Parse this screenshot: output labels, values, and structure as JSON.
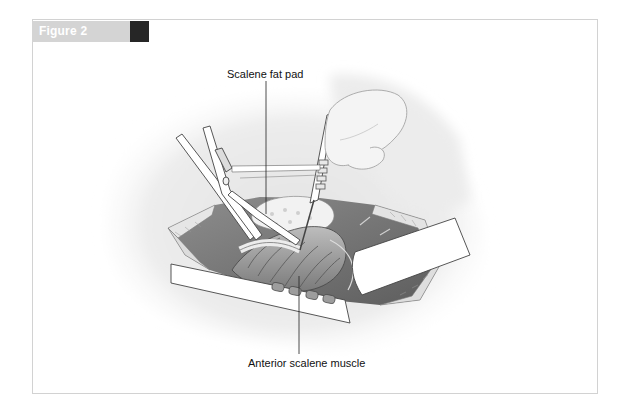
{
  "figure": {
    "title": "Figure 2",
    "accent_colors": {
      "tab_background": "#d4d4d4",
      "tab_square": "#262626",
      "frame_border": "#d2d2d2"
    }
  },
  "illustration": {
    "description": "Grayscale surgical illustration of a supraclavicular exposure showing retractors, forceps and an instrument dissecting the scalene fat pad over the anterior scalene muscle",
    "labels": [
      {
        "id": "scalene-fat-pad",
        "text": "Scalene fat pad"
      },
      {
        "id": "anterior-scalene-muscle",
        "text": "Anterior scalene muscle"
      }
    ]
  }
}
